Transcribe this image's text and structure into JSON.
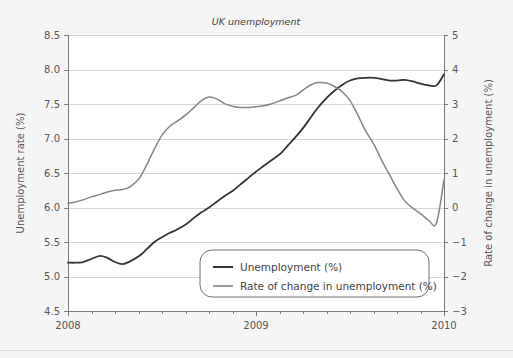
{
  "chart_data": {
    "type": "line",
    "title": "UK unemployment",
    "xlabel": "",
    "ylabel": "Unemployment rate (%)",
    "y2label": "Rate of change in unemployment (%)",
    "grid": true,
    "legend_position": "bottom-center-inside",
    "xlim": [
      2008.0,
      2010.0
    ],
    "ylim": [
      4.5,
      8.5
    ],
    "y2lim": [
      -3,
      5
    ],
    "x_tick_labels": [
      "2008",
      "2009",
      "2010"
    ],
    "x_tick_values": [
      2008,
      2009,
      2010
    ],
    "x_minor_ticks": [
      2008.125,
      2008.25,
      2008.375,
      2008.5,
      2008.625,
      2008.75,
      2008.875,
      2009.125,
      2009.25,
      2009.375,
      2009.5,
      2009.625,
      2009.75,
      2009.875
    ],
    "y_tick_labels": [
      "4.5",
      "5.0",
      "5.5",
      "6.0",
      "6.5",
      "7.0",
      "7.5",
      "8.0",
      "8.5"
    ],
    "y_tick_values": [
      4.5,
      5.0,
      5.5,
      6.0,
      6.5,
      7.0,
      7.5,
      8.0,
      8.5
    ],
    "y2_tick_labels": [
      "−3",
      "−2",
      "−1",
      "0",
      "1",
      "2",
      "3",
      "4",
      "5"
    ],
    "y2_tick_values": [
      -3,
      -2,
      -1,
      0,
      1,
      2,
      3,
      4,
      5
    ],
    "series": [
      {
        "name": "Unemployment (%)",
        "axis": "left",
        "color": "#333333",
        "width": 1.8,
        "x": [
          2008.0,
          2008.04,
          2008.08,
          2008.12,
          2008.17,
          2008.21,
          2008.25,
          2008.29,
          2008.33,
          2008.38,
          2008.42,
          2008.46,
          2008.5,
          2008.54,
          2008.58,
          2008.63,
          2008.67,
          2008.71,
          2008.75,
          2008.79,
          2008.83,
          2008.88,
          2008.92,
          2008.96,
          2009.0,
          2009.04,
          2009.08,
          2009.13,
          2009.17,
          2009.21,
          2009.25,
          2009.29,
          2009.33,
          2009.38,
          2009.42,
          2009.46,
          2009.5,
          2009.54,
          2009.58,
          2009.63,
          2009.67,
          2009.71,
          2009.75,
          2009.79,
          2009.83,
          2009.88,
          2009.92,
          2009.96,
          2010.0
        ],
        "y": [
          5.2,
          5.2,
          5.21,
          5.25,
          5.3,
          5.27,
          5.21,
          5.18,
          5.22,
          5.3,
          5.4,
          5.5,
          5.57,
          5.63,
          5.68,
          5.76,
          5.85,
          5.93,
          6.0,
          6.08,
          6.16,
          6.25,
          6.34,
          6.43,
          6.52,
          6.6,
          6.68,
          6.78,
          6.9,
          7.02,
          7.15,
          7.3,
          7.45,
          7.6,
          7.7,
          7.78,
          7.84,
          7.87,
          7.88,
          7.88,
          7.86,
          7.84,
          7.84,
          7.85,
          7.83,
          7.79,
          7.77,
          7.77,
          7.79
        ],
        "y_end_rise": 7.93
      },
      {
        "name": "Rate of change in unemployment (%)",
        "axis": "right",
        "color": "#858585",
        "width": 1.5,
        "x": [
          2008.0,
          2008.04,
          2008.08,
          2008.12,
          2008.17,
          2008.21,
          2008.25,
          2008.29,
          2008.33,
          2008.38,
          2008.42,
          2008.46,
          2008.5,
          2008.54,
          2008.58,
          2008.63,
          2008.67,
          2008.71,
          2008.75,
          2008.79,
          2008.83,
          2008.88,
          2008.92,
          2008.96,
          2009.0,
          2009.04,
          2009.08,
          2009.13,
          2009.17,
          2009.21,
          2009.25,
          2009.29,
          2009.33,
          2009.38,
          2009.42,
          2009.46,
          2009.5,
          2009.54,
          2009.58,
          2009.63,
          2009.67,
          2009.71,
          2009.75,
          2009.79,
          2009.83,
          2009.88,
          2009.92,
          2009.96,
          2010.0
        ],
        "y": [
          0.12,
          0.16,
          0.22,
          0.3,
          0.38,
          0.45,
          0.5,
          0.52,
          0.6,
          0.85,
          1.25,
          1.7,
          2.1,
          2.35,
          2.5,
          2.7,
          2.9,
          3.1,
          3.2,
          3.15,
          3.02,
          2.93,
          2.9,
          2.9,
          2.92,
          2.95,
          3.0,
          3.1,
          3.18,
          3.25,
          3.4,
          3.55,
          3.62,
          3.6,
          3.5,
          3.35,
          3.1,
          2.7,
          2.25,
          1.8,
          1.35,
          0.95,
          0.55,
          0.2,
          0.0,
          -0.2,
          -0.38,
          -0.45,
          -0.42
        ],
        "y_end_rise": 0.8
      }
    ]
  },
  "legend": {
    "items": [
      {
        "label": "Unemployment (%)",
        "color": "#333333"
      },
      {
        "label": "Rate of change in unemployment (%)",
        "color": "#858585"
      }
    ]
  }
}
